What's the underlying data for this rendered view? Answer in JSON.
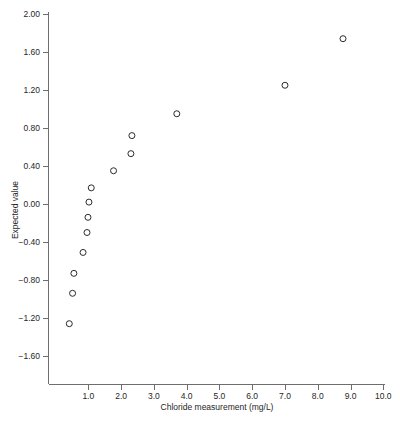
{
  "chart_data": {
    "type": "scatter",
    "title": "",
    "xlabel": "Chloride measurement (mg/L)",
    "ylabel": "Expected value",
    "xlim": [
      0.0,
      10.0
    ],
    "ylim": [
      -1.85,
      2.0
    ],
    "grid": false,
    "legend": null,
    "x_ticks": [
      1.0,
      2.0,
      3.0,
      4.0,
      5.0,
      6.0,
      7.0,
      8.0,
      9.0,
      10.0
    ],
    "x_tick_labels": [
      "1.0",
      "2.0",
      "3.0",
      "4.0",
      "5.0",
      "6.0",
      "7.0",
      "8.0",
      "9.0",
      "10.0"
    ],
    "y_ticks": [
      2.0,
      1.6,
      1.2,
      0.8,
      0.4,
      0.0,
      -0.4,
      -0.8,
      -1.2,
      -1.6
    ],
    "y_tick_labels": [
      "2.00",
      "1.60",
      "1.20",
      "0.80",
      "0.40",
      "0.00",
      "-0.40",
      "-0.80",
      "-1.20",
      "-1.60"
    ],
    "marker": "open-circle",
    "marker_color": "#2b2b2b",
    "points": [
      {
        "x": 0.42,
        "y": -1.26
      },
      {
        "x": 0.52,
        "y": -0.94
      },
      {
        "x": 0.56,
        "y": -0.73
      },
      {
        "x": 0.84,
        "y": -0.51
      },
      {
        "x": 0.96,
        "y": -0.3
      },
      {
        "x": 0.99,
        "y": -0.14
      },
      {
        "x": 1.02,
        "y": 0.02
      },
      {
        "x": 1.09,
        "y": 0.17
      },
      {
        "x": 1.77,
        "y": 0.35
      },
      {
        "x": 2.3,
        "y": 0.53
      },
      {
        "x": 2.33,
        "y": 0.72
      },
      {
        "x": 3.7,
        "y": 0.95
      },
      {
        "x": 7.0,
        "y": 1.25
      },
      {
        "x": 8.77,
        "y": 1.74
      }
    ]
  },
  "figure": {
    "background_color": "#ffffff",
    "axis_color": "#6e6e6e",
    "text_color": "#262626"
  }
}
